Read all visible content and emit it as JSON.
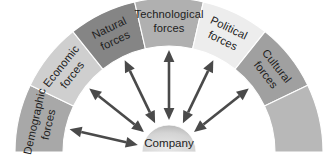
{
  "diagram": {
    "type": "semicircular-segmented-arc",
    "center_node": {
      "label": "Company",
      "shape": "semicircle-dome",
      "fill": "#d2d2d2"
    },
    "arrow_color": "#4a4a4a",
    "background": "#ffffff",
    "segments": [
      {
        "id": "demographic",
        "label_line1": "Demographic",
        "label_line2": "forces",
        "fill": "#a8a8a8",
        "angle_start": 180,
        "angle_end": 154.3
      },
      {
        "id": "economic",
        "label_line1": "Economic",
        "label_line2": "forces",
        "fill": "#cfcfcf",
        "angle_start": 154.3,
        "angle_end": 128.6
      },
      {
        "id": "natural",
        "label_line1": "Natural",
        "label_line2": "forces",
        "fill": "#858585",
        "angle_start": 128.6,
        "angle_end": 102.9
      },
      {
        "id": "technological",
        "label_line1": "Technological",
        "label_line2": "forces",
        "fill": "#b0b0b0",
        "angle_start": 102.9,
        "angle_end": 77.1
      },
      {
        "id": "political",
        "label_line1": "Political",
        "label_line2": "forces",
        "fill": "#ededed",
        "angle_start": 77.1,
        "angle_end": 51.4
      },
      {
        "id": "cultural",
        "label_line1": "Cultural",
        "label_line2": "forces",
        "fill": "#a0a0a0",
        "angle_start": 51.4,
        "angle_end": 25.7
      },
      {
        "id": "trailing",
        "label_line1": "",
        "label_line2": "",
        "fill": "#b8b8b8",
        "angle_start": 25.7,
        "angle_end": 0
      }
    ]
  }
}
